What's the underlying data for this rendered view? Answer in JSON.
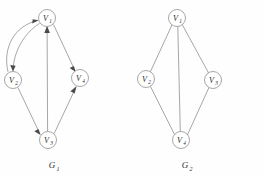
{
  "figure": {
    "background_color": "#fefefe",
    "line_color": "#8a8a8a",
    "arrow_color": "#4a4a4a",
    "text_color": "#2b2b2b"
  },
  "graphs": [
    {
      "id": "G1",
      "caption_base": "G",
      "caption_sub": "1",
      "directed": true,
      "nodes": [
        {
          "id": "V1",
          "base": "V",
          "sub": "1",
          "cx": 47,
          "cy": 18,
          "r": 8.5
        },
        {
          "id": "V2",
          "base": "V",
          "sub": "2",
          "cx": 13,
          "cy": 80,
          "r": 8.5
        },
        {
          "id": "V3",
          "base": "V",
          "sub": "3",
          "cx": 48,
          "cy": 140,
          "r": 8.5
        },
        {
          "id": "V4",
          "base": "V",
          "sub": "4",
          "cx": 80,
          "cy": 78,
          "r": 8.5
        }
      ],
      "edges": [
        {
          "from": "V2",
          "to": "V1",
          "shape": "curve",
          "arrow": true
        },
        {
          "from": "V1",
          "to": "V2",
          "shape": "curve",
          "arrow": true
        },
        {
          "from": "V3",
          "to": "V1",
          "shape": "line",
          "arrow": true
        },
        {
          "from": "V1",
          "to": "V4",
          "shape": "line",
          "arrow": true
        },
        {
          "from": "V2",
          "to": "V3",
          "shape": "line",
          "arrow": true
        },
        {
          "from": "V3",
          "to": "V4",
          "shape": "line",
          "arrow": true
        }
      ]
    },
    {
      "id": "G2",
      "caption_base": "G",
      "caption_sub": "2",
      "directed": false,
      "nodes": [
        {
          "id": "V1",
          "base": "V",
          "sub": "1",
          "cx": 177,
          "cy": 18,
          "r": 8.5
        },
        {
          "id": "V2",
          "base": "V",
          "sub": "2",
          "cx": 146,
          "cy": 79,
          "r": 8.5
        },
        {
          "id": "V3",
          "base": "V",
          "sub": "3",
          "cx": 213,
          "cy": 80,
          "r": 8.5
        },
        {
          "id": "V4",
          "base": "V",
          "sub": "4",
          "cx": 181,
          "cy": 140,
          "r": 8.5
        }
      ],
      "edges": [
        {
          "from": "V1",
          "to": "V2",
          "shape": "line",
          "arrow": false
        },
        {
          "from": "V1",
          "to": "V3",
          "shape": "line",
          "arrow": false
        },
        {
          "from": "V1",
          "to": "V4",
          "shape": "line",
          "arrow": false
        },
        {
          "from": "V2",
          "to": "V4",
          "shape": "line",
          "arrow": false
        },
        {
          "from": "V3",
          "to": "V4",
          "shape": "line",
          "arrow": false
        }
      ]
    }
  ],
  "captions": {
    "g1": "G1",
    "g2": "G2"
  }
}
